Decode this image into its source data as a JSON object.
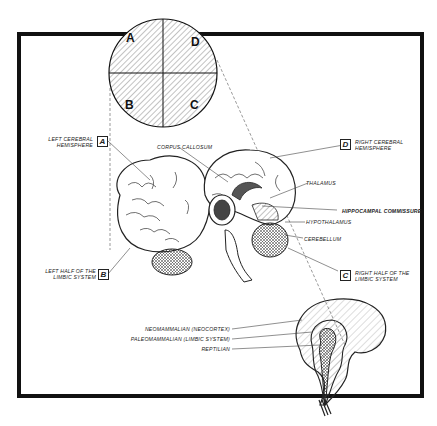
{
  "figure": {
    "quadrant_letters": [
      "A",
      "D",
      "B",
      "C"
    ],
    "labels": {
      "left_cerebral": {
        "line1": "Left cerebral",
        "line2": "hemisphere",
        "box": "A"
      },
      "right_cerebral": {
        "line1": "Right cerebral",
        "line2": "hemisphere",
        "box": "D"
      },
      "left_limbic": {
        "line1": "Left half of the",
        "line2": "limbic system",
        "box": "B"
      },
      "right_limbic": {
        "line1": "Right half of the",
        "line2": "limbic system",
        "box": "C"
      },
      "corpus_callosum": "Corpus callosum",
      "thalamus": "Thalamus",
      "hippocampal_commissure": "Hippocampal commissure",
      "hypothalamus": "Hypothalamus",
      "cerebellum": "Cerebellum",
      "neomammalian": "Neomammalian (neocortex)",
      "paleomammalian": "Paleomammalian (limbic system)",
      "reptilian": "Reptilian"
    },
    "colors": {
      "ink": "#1a1a1a",
      "paper": "#ffffff",
      "frame": "#111111"
    }
  }
}
